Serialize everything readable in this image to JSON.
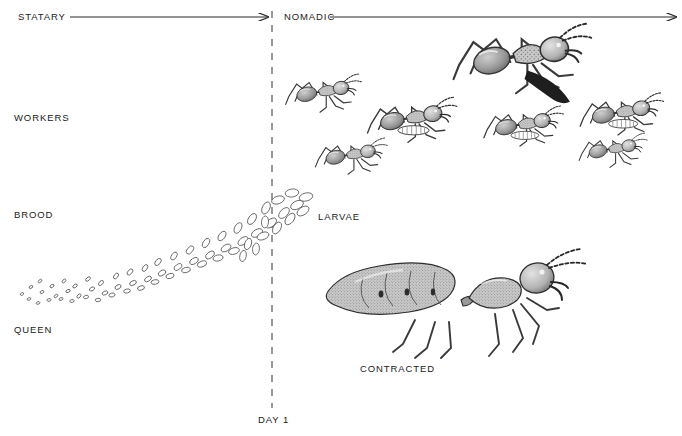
{
  "figure": {
    "title_statary": "STATARY",
    "title_nomadic": "NOMADIC",
    "row_labels": [
      {
        "id": "workers",
        "text": "WORKERS",
        "x": 14,
        "y": 118
      },
      {
        "id": "brood",
        "text": "BROOD",
        "x": 14,
        "y": 215
      },
      {
        "id": "queen",
        "text": "QUEEN",
        "x": 14,
        "y": 330
      }
    ],
    "annotations": [
      {
        "id": "larvae",
        "text": "LARVAE",
        "x": 318,
        "y": 219
      },
      {
        "id": "contracted",
        "text": "CONTRACTED",
        "x": 360,
        "y": 371
      },
      {
        "id": "day-1",
        "text": "DAY  1",
        "x": 258,
        "y": 422
      }
    ],
    "phase_divider": {
      "label": "DAY  1",
      "x": 272,
      "y_top": 12,
      "y_bottom": 410
    },
    "statary_arrow": {
      "x1": 70,
      "x2": 270,
      "y": 17
    },
    "nomadic_arrow": {
      "x1": 330,
      "x2": 678,
      "y": 17
    },
    "colors": {
      "ink": "#1b1b1b",
      "line": "#2a2a2a",
      "dash": "#555555",
      "background": "#ffffff",
      "shading": "#6f6f6f",
      "light_shading": "#b4b4b4"
    },
    "illustrations": [
      {
        "id": "worker-ant-large",
        "name": "army ant worker (major), lateral view",
        "cx": 520,
        "cy": 62,
        "scale": 1.35
      },
      {
        "id": "worker-ant-upper-left",
        "name": "army ant worker facing right",
        "cx": 320,
        "cy": 95,
        "scale": 0.78
      },
      {
        "id": "worker-ant-center",
        "name": "army ant worker carrying larva",
        "cx": 410,
        "cy": 122,
        "scale": 0.9
      },
      {
        "id": "worker-ant-lower-left",
        "name": "army ant worker facing right",
        "cx": 350,
        "cy": 158,
        "scale": 0.74
      },
      {
        "id": "worker-ant-mid-right",
        "name": "army ant worker carrying larva",
        "cx": 524,
        "cy": 128,
        "scale": 0.8
      },
      {
        "id": "worker-ant-far-right-upper",
        "name": "army ant worker carrying larva",
        "cx": 622,
        "cy": 118,
        "scale": 0.84
      },
      {
        "id": "worker-ant-far-right-lower",
        "name": "army ant worker facing right",
        "cx": 612,
        "cy": 152,
        "scale": 0.7
      },
      {
        "id": "queen-ant-contracted",
        "name": "army ant queen with contracted gaster",
        "cx": 460,
        "cy": 300,
        "scale": 1.0
      }
    ],
    "brood_trail": {
      "description": "eggs at left growing into larvae toward the right along a rising diagonal",
      "start": {
        "x": 20,
        "y": 296
      },
      "end": {
        "x": 312,
        "y": 196
      },
      "egg_count": 64
    }
  }
}
